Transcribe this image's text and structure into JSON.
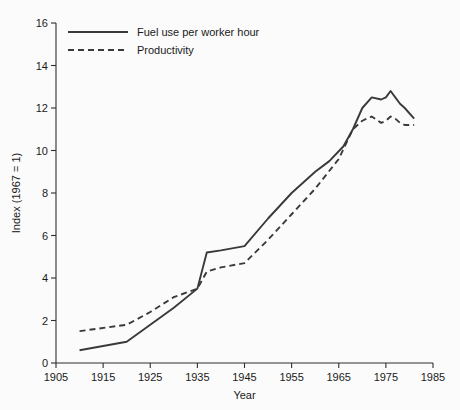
{
  "chart_data": {
    "type": "line",
    "title": "",
    "xlabel": "Year",
    "ylabel": "Index (1967 = 1)",
    "xlim": [
      1905,
      1985
    ],
    "ylim": [
      0,
      16
    ],
    "xticks": [
      1905,
      1915,
      1925,
      1935,
      1945,
      1955,
      1965,
      1975,
      1985
    ],
    "xtick_labels": [
      "1905",
      "1915",
      "1925",
      "1935",
      "1945",
      "1955",
      "1965",
      "1975",
      "1985"
    ],
    "yticks": [
      0,
      2,
      4,
      6,
      8,
      10,
      12,
      14,
      16
    ],
    "ytick_labels": [
      "0",
      "2",
      "4",
      "6",
      "8",
      "10",
      "12",
      "14",
      "16"
    ],
    "grid": false,
    "legend_position": "top-left",
    "line_color": "#3a3a3a",
    "series": [
      {
        "name": "Fuel use per worker hour",
        "style": "solid",
        "x": [
          1910,
          1920,
          1925,
          1930,
          1935,
          1937,
          1940,
          1945,
          1950,
          1955,
          1960,
          1963,
          1966,
          1968,
          1970,
          1972,
          1974,
          1975,
          1976,
          1977,
          1978,
          1979,
          1981
        ],
        "values": [
          0.6,
          1.0,
          1.8,
          2.6,
          3.5,
          5.2,
          5.3,
          5.5,
          6.8,
          8.0,
          9.0,
          9.5,
          10.2,
          11.0,
          12.0,
          12.5,
          12.4,
          12.5,
          12.8,
          12.5,
          12.2,
          12.0,
          11.5
        ]
      },
      {
        "name": "Productivity",
        "style": "dashed",
        "x": [
          1910,
          1920,
          1925,
          1930,
          1935,
          1937,
          1940,
          1945,
          1950,
          1955,
          1960,
          1965,
          1968,
          1970,
          1972,
          1974,
          1975,
          1976,
          1977,
          1978,
          1979,
          1981
        ],
        "values": [
          1.5,
          1.8,
          2.4,
          3.1,
          3.5,
          4.3,
          4.5,
          4.7,
          5.8,
          7.0,
          8.2,
          9.6,
          11.0,
          11.4,
          11.6,
          11.3,
          11.4,
          11.6,
          11.5,
          11.3,
          11.2,
          11.2
        ]
      }
    ]
  },
  "legend": {
    "items": [
      {
        "label": "Fuel use per worker hour",
        "style": "solid"
      },
      {
        "label": "Productivity",
        "style": "dashed"
      }
    ]
  }
}
